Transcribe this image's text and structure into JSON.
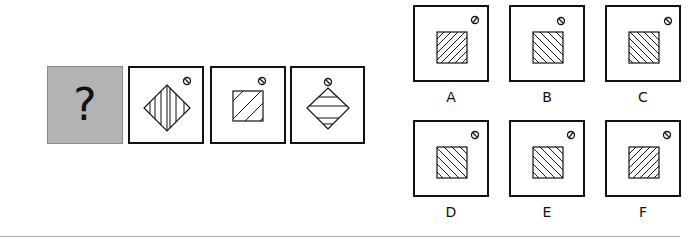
{
  "question": {
    "placeholder_symbol": "?",
    "placeholder_bg": "#b3b3b3"
  },
  "sequence": [
    {
      "shape": "diamond",
      "hatch": "vertical",
      "symbol": "circle-backslash"
    },
    {
      "shape": "square",
      "hatch": "forward-diagonal",
      "symbol": "circle-backslash"
    },
    {
      "shape": "diamond",
      "hatch": "horizontal",
      "symbol": "circle-backslash"
    }
  ],
  "options": [
    {
      "label": "A",
      "shape": "square",
      "hatch": "forward-diagonal",
      "symbol": "circle-slash"
    },
    {
      "label": "B",
      "shape": "square",
      "hatch": "back-diagonal",
      "symbol": "circle-backslash"
    },
    {
      "label": "C",
      "shape": "square",
      "hatch": "back-diagonal",
      "symbol": "circle-backslash"
    },
    {
      "label": "D",
      "shape": "square",
      "hatch": "back-diagonal",
      "symbol": "circle-backslash"
    },
    {
      "label": "E",
      "shape": "square",
      "hatch": "back-diagonal",
      "symbol": "circle-slash"
    },
    {
      "label": "F",
      "shape": "square",
      "hatch": "forward-diagonal",
      "symbol": "circle-backslash"
    }
  ]
}
